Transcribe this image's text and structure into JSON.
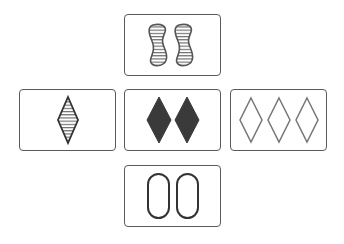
{
  "game": "Set",
  "colors": {
    "ink": "#3a3a3a",
    "border": "#5a5a5a",
    "background": "#ffffff"
  },
  "cards": [
    {
      "id": "card-top",
      "position": "top",
      "count": 2,
      "shape": "squiggle",
      "shading": "striped",
      "label": "2 striped squiggles"
    },
    {
      "id": "card-left",
      "position": "left",
      "count": 1,
      "shape": "diamond",
      "shading": "striped",
      "label": "1 striped diamond"
    },
    {
      "id": "card-center",
      "position": "center",
      "count": 2,
      "shape": "diamond",
      "shading": "solid",
      "label": "2 solid diamonds"
    },
    {
      "id": "card-right",
      "position": "right",
      "count": 3,
      "shape": "diamond",
      "shading": "open",
      "label": "3 open diamonds"
    },
    {
      "id": "card-bottom",
      "position": "bottom",
      "count": 2,
      "shape": "oval",
      "shading": "open",
      "label": "2 open ovals"
    }
  ]
}
